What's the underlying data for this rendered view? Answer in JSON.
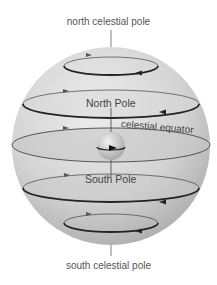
{
  "diagram": {
    "labels": {
      "north_celestial_pole": "north celestial pole",
      "south_celestial_pole": "south celestial pole",
      "north_pole": "North Pole",
      "south_pole": "South Pole",
      "celestial_equator": "celestial equator"
    },
    "colors": {
      "sphere_light": "#e6e6e6",
      "sphere_dark": "#a9a9a9",
      "path_line": "#2a2a2a",
      "text": "#555555",
      "earth": "#cfcfcf"
    },
    "circles": [
      {
        "name": "north-polar-circle",
        "cy": 66,
        "rx": 47,
        "ry": 9
      },
      {
        "name": "north-mid-circle",
        "cy": 104,
        "rx": 88,
        "ry": 14
      },
      {
        "name": "celestial-equator-circle",
        "cy": 145,
        "rx": 99,
        "ry": 17
      },
      {
        "name": "south-mid-circle",
        "cy": 188,
        "rx": 88,
        "ry": 14
      },
      {
        "name": "south-polar-circle",
        "cy": 223,
        "rx": 47,
        "ry": 9
      }
    ]
  }
}
